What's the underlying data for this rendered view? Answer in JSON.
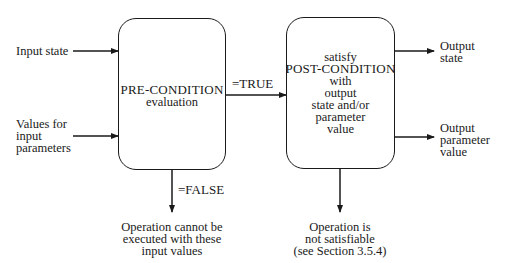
{
  "diagram": {
    "inputs": {
      "input_state": "Input state",
      "values_for_input_parameters": [
        "Values for",
        "input",
        "parameters"
      ]
    },
    "precondition_box": {
      "title": "PRE-CONDITION",
      "subtitle": "evaluation"
    },
    "true_label": "=TRUE",
    "false_label": "=FALSE",
    "postcondition_box": {
      "lines": [
        "satisfy",
        "POST-CONDITION",
        "with",
        "output",
        "state and/or",
        "parameter",
        "value"
      ]
    },
    "outputs": {
      "output_state": [
        "Output",
        "state"
      ],
      "output_parameter_value": [
        "Output",
        "parameter",
        "value"
      ]
    },
    "false_outcome": [
      "Operation cannot be",
      "executed with these",
      "input values"
    ],
    "unsatisfiable_outcome": [
      "Operation is",
      "not satisfiable",
      "(see Section 3.5.4)"
    ],
    "colors": {
      "ink": "#1a1a1a",
      "background": "#ffffff"
    }
  }
}
